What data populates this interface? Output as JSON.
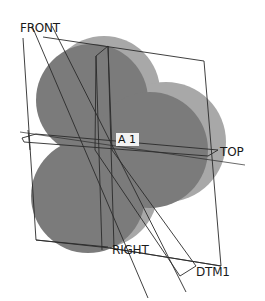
{
  "viewport": {
    "background": "#ffffff",
    "model": {
      "front_face_color": "#7a7a7a",
      "side_face_color": "#a6a6a6"
    },
    "datum_planes": [
      {
        "name": "FRONT"
      },
      {
        "name": "TOP"
      },
      {
        "name": "RIGHT"
      },
      {
        "name": "DTM1"
      }
    ],
    "datum_axis": {
      "name": "A_1",
      "display": "A  1"
    }
  }
}
